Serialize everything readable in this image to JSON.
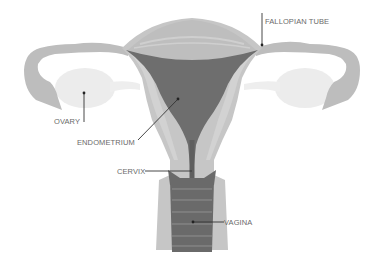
{
  "diagram": {
    "labels": {
      "fallopian_tube": "FALLOPIAN TUBE",
      "ovary": "OVARY",
      "endometrium": "ENDOMETRIUM",
      "cervix": "CERVIX",
      "vagina": "VAGINA"
    },
    "colors": {
      "background": "#ffffff",
      "tube_and_muscle": "#bdbdbd",
      "muscle_light": "#cfcfcf",
      "fundus": "#c4c4c4",
      "endometrium_cavity": "#6e6e6e",
      "vagina_canal": "#6a6a6a",
      "ovary": "#ececec",
      "label_text": "#6a6a6a",
      "leader_line": "#333333"
    }
  }
}
